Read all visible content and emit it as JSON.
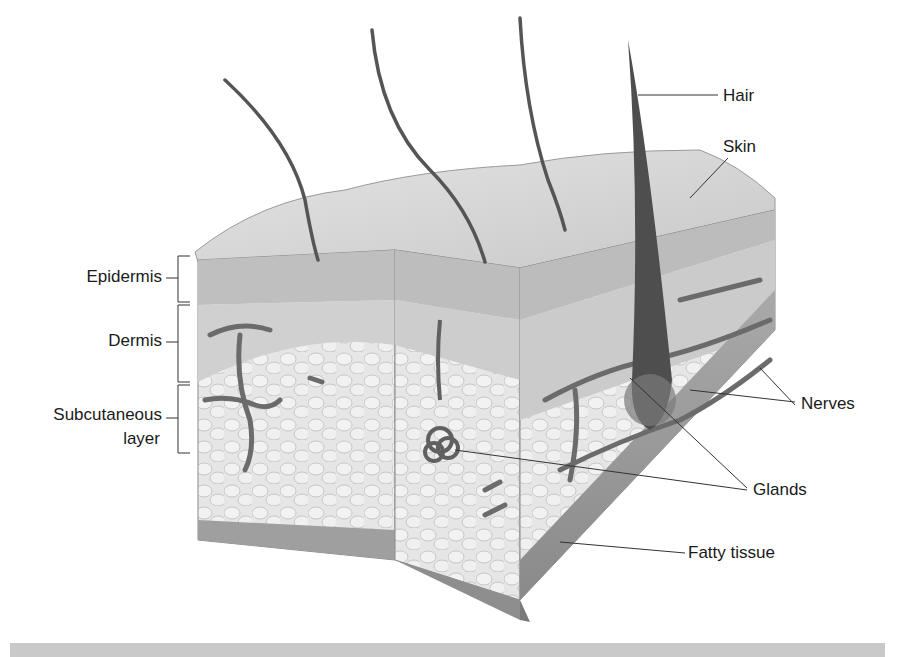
{
  "figure": {
    "labels_left": [
      {
        "id": "epidermis",
        "text": "Epidermis"
      },
      {
        "id": "dermis",
        "text": "Dermis"
      },
      {
        "id": "subcutaneous",
        "text": "Subcutaneous",
        "text2": "layer"
      }
    ],
    "labels_right": [
      {
        "id": "hair",
        "text": "Hair"
      },
      {
        "id": "skin",
        "text": "Skin"
      },
      {
        "id": "nerves",
        "text": "Nerves"
      },
      {
        "id": "glands",
        "text": "Glands"
      },
      {
        "id": "fatty_tissue",
        "text": "Fatty tissue"
      }
    ]
  },
  "colors": {
    "surface_top": "#d4d4d4",
    "epidermis": "#bdbdbd",
    "dermis": "#cfcfcf",
    "fat": "#e2e2e2",
    "vessel": "#6e6e6e",
    "hair": "#505050",
    "line": "#333333",
    "bottom_bar": "#c9c9c9"
  }
}
